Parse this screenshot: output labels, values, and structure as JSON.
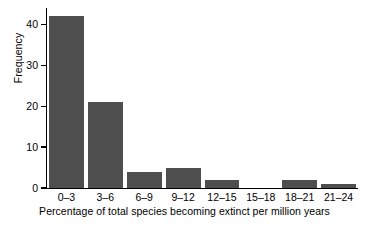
{
  "chart_data": {
    "type": "bar",
    "title": "",
    "xlabel": "Percentage of total species becoming extinct per million years",
    "ylabel": "Frequency",
    "categories": [
      "0–3",
      "3–6",
      "6–9",
      "9–12",
      "12–15",
      "15–18",
      "18–21",
      "21–24"
    ],
    "values": [
      42,
      21,
      4,
      5,
      2,
      0,
      2,
      1
    ],
    "ylim": [
      0,
      44
    ],
    "yticks": [
      0,
      10,
      20,
      30,
      40
    ],
    "ytick_labels": [
      "0",
      "10",
      "20",
      "30",
      "40"
    ],
    "grid": false,
    "legend": false,
    "bar_color": "#4e4e4e",
    "axis_color": "#000000",
    "background_color": "#ffffff"
  }
}
